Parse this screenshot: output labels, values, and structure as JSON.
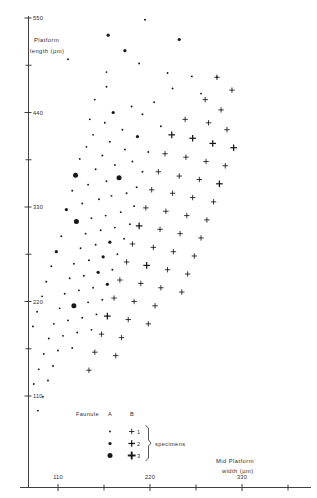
{
  "figure": {
    "kind": "scatter-plot",
    "background": "#ffffff",
    "ink_color": "#171717"
  },
  "chart_data": {
    "type": "scatter",
    "title": "",
    "xlabel": "Mid Platform width (µm)",
    "ylabel": "Platform length (µm)",
    "xlim": [
      60,
      390
    ],
    "ylim": [
      40,
      575
    ],
    "xticks": [
      110,
      220,
      330
    ],
    "xtick_labels": [
      "110",
      "220",
      "330"
    ],
    "x_minor_ticks": [
      165,
      275,
      385
    ],
    "yticks": [
      110,
      220,
      330,
      440,
      550
    ],
    "ytick_labels": [
      "110",
      "220",
      "330",
      "440",
      "550"
    ],
    "y_minor_ticks": [
      165,
      275,
      385,
      495
    ],
    "grid": false,
    "legend_position": "bottom-left-inside",
    "series": [
      {
        "name": "Faunule A",
        "marker": "dot",
        "points": [
          [
            214,
            548
          ],
          [
            170,
            530
          ],
          [
            255,
            525
          ],
          [
            190,
            512
          ],
          [
            122,
            502
          ],
          [
            207,
            497
          ],
          [
            168,
            487
          ],
          [
            241,
            486
          ],
          [
            270,
            482
          ],
          [
            300,
            481
          ],
          [
            168,
            470
          ],
          [
            247,
            468
          ],
          [
            281,
            462
          ],
          [
            154,
            455
          ],
          [
            225,
            452
          ],
          [
            198,
            447
          ],
          [
            176,
            440
          ],
          [
            211,
            438
          ],
          [
            148,
            432
          ],
          [
            166,
            428
          ],
          [
            233,
            424
          ],
          [
            187,
            420
          ],
          [
            152,
            414
          ],
          [
            205,
            412
          ],
          [
            172,
            406
          ],
          [
            144,
            400
          ],
          [
            190,
            397
          ],
          [
            218,
            394
          ],
          [
            163,
            390
          ],
          [
            136,
            386
          ],
          [
            199,
            383
          ],
          [
            178,
            379
          ],
          [
            155,
            374
          ],
          [
            211,
            371
          ],
          [
            131,
            367
          ],
          [
            183,
            364
          ],
          [
            168,
            360
          ],
          [
            146,
            356
          ],
          [
            204,
            353
          ],
          [
            127,
            349
          ],
          [
            192,
            346
          ],
          [
            174,
            343
          ],
          [
            159,
            339
          ],
          [
            139,
            334
          ],
          [
            201,
            331
          ],
          [
            120,
            327
          ],
          [
            185,
            324
          ],
          [
            167,
            320
          ],
          [
            150,
            317
          ],
          [
            132,
            313
          ],
          [
            196,
            310
          ],
          [
            178,
            306
          ],
          [
            161,
            303
          ],
          [
            143,
            299
          ],
          [
            114,
            296
          ],
          [
            189,
            293
          ],
          [
            172,
            289
          ],
          [
            155,
            286
          ],
          [
            137,
            282
          ],
          [
            108,
            278
          ],
          [
            181,
            275
          ],
          [
            164,
            272
          ],
          [
            147,
            268
          ],
          [
            129,
            264
          ],
          [
            102,
            261
          ],
          [
            175,
            257
          ],
          [
            158,
            254
          ],
          [
            141,
            250
          ],
          [
            124,
            247
          ],
          [
            96,
            243
          ],
          [
            169,
            240
          ],
          [
            152,
            236
          ],
          [
            135,
            233
          ],
          [
            118,
            229
          ],
          [
            91,
            226
          ],
          [
            163,
            222
          ],
          [
            146,
            219
          ],
          [
            129,
            215
          ],
          [
            112,
            212
          ],
          [
            85,
            208
          ],
          [
            156,
            205
          ],
          [
            139,
            201
          ],
          [
            122,
            198
          ],
          [
            105,
            194
          ],
          [
            80,
            191
          ],
          [
            150,
            187
          ],
          [
            133,
            184
          ],
          [
            116,
            180
          ],
          [
            99,
            177
          ],
          [
            74,
            173
          ],
          [
            127,
            166
          ],
          [
            110,
            163
          ],
          [
            93,
            159
          ],
          [
            69,
            155
          ],
          [
            104,
            145
          ],
          [
            87,
            141
          ],
          [
            63,
            138
          ],
          [
            98,
            128
          ],
          [
            81,
            124
          ],
          [
            75,
            112
          ],
          [
            92,
            109
          ],
          [
            69,
            96
          ],
          [
            86,
            93
          ],
          [
            63,
            72
          ]
        ]
      },
      {
        "name": "Faunule B",
        "marker": "plus",
        "points": [
          [
            300,
            481
          ],
          [
            318,
            466
          ],
          [
            286,
            455
          ],
          [
            305,
            443
          ],
          [
            262,
            432
          ],
          [
            290,
            428
          ],
          [
            312,
            420
          ],
          [
            246,
            414
          ],
          [
            271,
            410
          ],
          [
            295,
            404
          ],
          [
            320,
            399
          ],
          [
            238,
            392
          ],
          [
            263,
            388
          ],
          [
            287,
            383
          ],
          [
            310,
            378
          ],
          [
            230,
            371
          ],
          [
            255,
            366
          ],
          [
            279,
            362
          ],
          [
            303,
            357
          ],
          [
            222,
            350
          ],
          [
            247,
            346
          ],
          [
            271,
            341
          ],
          [
            296,
            336
          ],
          [
            215,
            329
          ],
          [
            239,
            325
          ],
          [
            264,
            320
          ],
          [
            288,
            315
          ],
          [
            207,
            308
          ],
          [
            232,
            304
          ],
          [
            256,
            299
          ],
          [
            281,
            294
          ],
          [
            199,
            287
          ],
          [
            224,
            283
          ],
          [
            248,
            278
          ],
          [
            273,
            273
          ],
          [
            192,
            266
          ],
          [
            216,
            262
          ],
          [
            241,
            257
          ],
          [
            265,
            252
          ],
          [
            184,
            245
          ],
          [
            209,
            241
          ],
          [
            233,
            236
          ],
          [
            258,
            231
          ],
          [
            177,
            224
          ],
          [
            201,
            220
          ],
          [
            226,
            215
          ],
          [
            169,
            203
          ],
          [
            194,
            199
          ],
          [
            218,
            194
          ],
          [
            162,
            182
          ],
          [
            186,
            178
          ],
          [
            154,
            161
          ],
          [
            179,
            157
          ],
          [
            147,
            140
          ]
        ]
      }
    ],
    "marker_size_legend": {
      "title": "Faunule",
      "columns": [
        "A",
        "B"
      ],
      "rows": [
        {
          "count": "1",
          "size": "small"
        },
        {
          "count": "2",
          "size": "medium"
        },
        {
          "count": "3",
          "size": "large"
        }
      ],
      "unit_label": "specimens"
    }
  },
  "axes": {
    "y_title_line1": "Platform",
    "y_title_line2": "length (µm)",
    "x_title_line1": "Mid Platform",
    "x_title_line2": "width (µm)"
  },
  "legend": {
    "title": "Faunule",
    "col_a": "A",
    "col_b": "B",
    "row1": "1",
    "row2": "2",
    "row3": "3",
    "unit": "specimens"
  }
}
